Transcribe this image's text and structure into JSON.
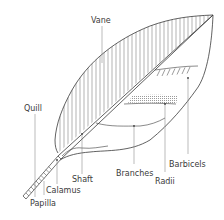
{
  "diagram": {
    "labels": {
      "vane": "Vane",
      "quill": "Quill",
      "calamus": "Calamus",
      "papilla": "Papilla",
      "shaft": "Shaft",
      "branches": "Branches",
      "radii": "Radii",
      "barbicels": "Barbicels"
    },
    "colors": {
      "line": "#3a3a3a",
      "hatch": "#555555",
      "shading": "#bdbdbd",
      "background": "#ffffff"
    }
  }
}
